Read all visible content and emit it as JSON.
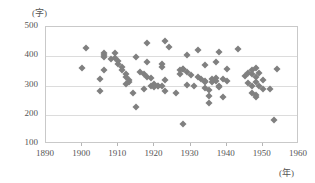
{
  "chart_data": {
    "type": "scatter",
    "title": "",
    "subtitle": "",
    "xlabel": "(年)",
    "ylabel": "(字)",
    "xlim": [
      1890,
      1960
    ],
    "ylim": [
      100,
      500
    ],
    "xticks": [
      1890,
      1900,
      1910,
      1920,
      1930,
      1940,
      1950,
      1960
    ],
    "yticks": [
      100,
      200,
      300,
      400,
      500
    ],
    "grid": true,
    "legend": null,
    "marker": "diamond",
    "marker_color": "#808080",
    "series": [
      {
        "name": "",
        "points": [
          [
            1900,
            360
          ],
          [
            1901,
            427
          ],
          [
            1905,
            281
          ],
          [
            1905,
            321
          ],
          [
            1906,
            404
          ],
          [
            1906,
            411
          ],
          [
            1906,
            396
          ],
          [
            1906,
            354
          ],
          [
            1908,
            390
          ],
          [
            1909,
            412
          ],
          [
            1909,
            395
          ],
          [
            1910,
            385
          ],
          [
            1910,
            374
          ],
          [
            1911,
            363
          ],
          [
            1911,
            352
          ],
          [
            1912,
            341
          ],
          [
            1912,
            305
          ],
          [
            1912,
            330
          ],
          [
            1913,
            320
          ],
          [
            1913,
            312
          ],
          [
            1914,
            275
          ],
          [
            1915,
            397
          ],
          [
            1915,
            227
          ],
          [
            1916,
            345
          ],
          [
            1917,
            338
          ],
          [
            1917,
            289
          ],
          [
            1918,
            447
          ],
          [
            1918,
            380
          ],
          [
            1918,
            330
          ],
          [
            1919,
            324
          ],
          [
            1919,
            297
          ],
          [
            1920,
            305
          ],
          [
            1920,
            296
          ],
          [
            1921,
            300
          ],
          [
            1921,
            297
          ],
          [
            1922,
            372
          ],
          [
            1922,
            363
          ],
          [
            1922,
            299
          ],
          [
            1923,
            452
          ],
          [
            1923,
            320
          ],
          [
            1923,
            281
          ],
          [
            1924,
            431
          ],
          [
            1926,
            273
          ],
          [
            1927,
            340
          ],
          [
            1927,
            352
          ],
          [
            1928,
            356
          ],
          [
            1928,
            355
          ],
          [
            1928,
            170
          ],
          [
            1929,
            404
          ],
          [
            1929,
            346
          ],
          [
            1929,
            302
          ],
          [
            1930,
            337
          ],
          [
            1931,
            300
          ],
          [
            1932,
            423
          ],
          [
            1932,
            328
          ],
          [
            1933,
            322
          ],
          [
            1934,
            369
          ],
          [
            1934,
            315
          ],
          [
            1934,
            313
          ],
          [
            1934,
            290
          ],
          [
            1935,
            285
          ],
          [
            1935,
            263
          ],
          [
            1935,
            240
          ],
          [
            1936,
            322
          ],
          [
            1936,
            311
          ],
          [
            1937,
            379
          ],
          [
            1937,
            325
          ],
          [
            1937,
            316
          ],
          [
            1938,
            414
          ],
          [
            1938,
            300
          ],
          [
            1938,
            294
          ],
          [
            1939,
            259
          ],
          [
            1939,
            322
          ],
          [
            1940,
            358
          ],
          [
            1940,
            316
          ],
          [
            1943,
            424
          ],
          [
            1945,
            334
          ],
          [
            1946,
            344
          ],
          [
            1946,
            310
          ],
          [
            1947,
            352
          ],
          [
            1947,
            340
          ],
          [
            1947,
            297
          ],
          [
            1947,
            276
          ],
          [
            1948,
            360
          ],
          [
            1948,
            330
          ],
          [
            1948,
            313
          ],
          [
            1948,
            262
          ],
          [
            1948,
            268
          ],
          [
            1949,
            344
          ],
          [
            1949,
            300
          ],
          [
            1950,
            318
          ],
          [
            1950,
            289
          ],
          [
            1952,
            289
          ],
          [
            1953,
            182
          ],
          [
            1954,
            357
          ]
        ]
      }
    ]
  },
  "axis": {
    "y_unit": "(字)",
    "x_unit": "(年)",
    "y_tick_labels": [
      "500",
      "400",
      "300",
      "200",
      "100"
    ],
    "x_tick_labels": [
      "1890",
      "1900",
      "1910",
      "1920",
      "1930",
      "1940",
      "1950",
      "1960"
    ]
  },
  "colors": {
    "marker": "#808080",
    "grid": "#dcdcdc",
    "frame": "#c9c9c9",
    "text": "#555555"
  }
}
